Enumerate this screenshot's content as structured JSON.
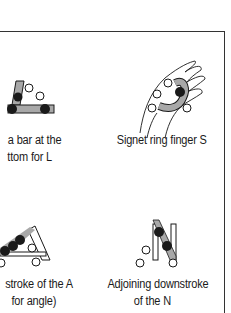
{
  "figures": [
    {
      "id": "L",
      "caption_line1": "a bar at the",
      "caption_line2": "ttom for L",
      "icon": "hand-sign-L-icon"
    },
    {
      "id": "S",
      "caption_line1": "Signet ring finger S",
      "caption_line2": "",
      "icon": "hand-sign-S-icon"
    },
    {
      "id": "A",
      "caption_line1": "stroke of the A",
      "caption_line2": "for angle)",
      "icon": "hand-sign-A-icon"
    },
    {
      "id": "N",
      "caption_line1": "Adjoining downstroke",
      "caption_line2": "of the N",
      "icon": "hand-sign-N-icon"
    }
  ],
  "colors": {
    "ink": "#1a1a1a",
    "bar_fill": "#a8a8a8",
    "frame": "#333333"
  }
}
